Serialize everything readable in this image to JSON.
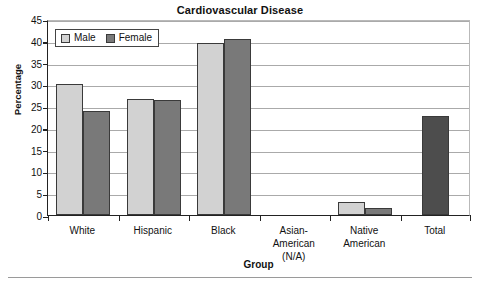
{
  "chart_data": {
    "type": "bar",
    "title": "Cardiovascular Disease",
    "xlabel": "Group",
    "ylabel": "Percentage",
    "ylim": [
      0,
      45
    ],
    "ytick_step": 5,
    "yticks": [
      0,
      5,
      10,
      15,
      20,
      25,
      30,
      35,
      40,
      45
    ],
    "grid": true,
    "legend_position": "top-left-inside",
    "categories": [
      "White",
      "Hispanic",
      "Black",
      "Asian-American (N/A)",
      "Native American",
      "Total"
    ],
    "category_lines": [
      [
        "White",
        ""
      ],
      [
        "Hispanic",
        ""
      ],
      [
        "Black",
        ""
      ],
      [
        "Asian-American",
        "(N/A)"
      ],
      [
        "Native",
        "American"
      ],
      [
        "Total",
        ""
      ]
    ],
    "series": [
      {
        "name": "Male",
        "color": "#d2d2d2",
        "values": [
          30.0,
          26.7,
          39.5,
          null,
          3.0,
          null
        ]
      },
      {
        "name": "Female",
        "color": "#797979",
        "values": [
          23.9,
          26.5,
          40.5,
          null,
          1.5,
          null
        ]
      },
      {
        "name": "Total",
        "color": "#4d4d4d",
        "values": [
          null,
          null,
          null,
          null,
          null,
          22.7
        ]
      }
    ]
  },
  "legend": {
    "items": [
      {
        "label": "Male",
        "color": "#d2d2d2"
      },
      {
        "label": "Female",
        "color": "#797979"
      }
    ]
  },
  "colors": {
    "male": "#d2d2d2",
    "female": "#797979",
    "total": "#4d4d4d",
    "bar_outline": "#3a3a3a",
    "axis": "#222222",
    "grid": "#aaaaaa",
    "text": "#111111"
  }
}
